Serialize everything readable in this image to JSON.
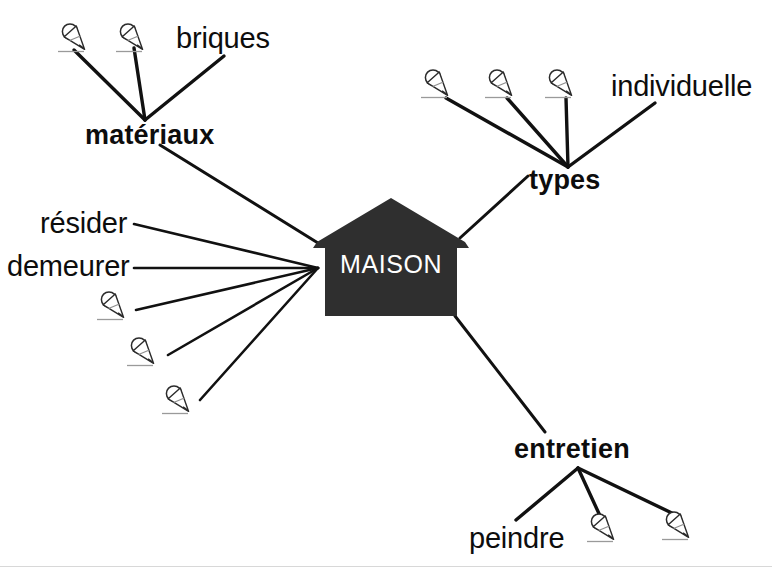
{
  "diagram": {
    "title": "MAISON",
    "type": "mind-map",
    "background_color": "#ffffff",
    "line_color": "#111111",
    "text_color": "#0d0d0d",
    "center_fill": "#2f2f2f",
    "center_text_color": "#ffffff",
    "center": {
      "label": "MAISON",
      "shape": "house-pentagon",
      "x": 313,
      "y": 196,
      "width": 156,
      "height": 122
    },
    "branches": [
      {
        "id": "materiaux",
        "label": "matériaux",
        "weight": "bold",
        "x": 85,
        "y": 120,
        "hub": {
          "x": 145,
          "y": 120
        },
        "children": [
          {
            "type": "icon",
            "icon": "pencil-writing-icon",
            "x": 57,
            "y": 22
          },
          {
            "type": "icon",
            "icon": "pencil-writing-icon",
            "x": 115,
            "y": 22
          },
          {
            "type": "text",
            "label": "briques",
            "weight": "regular",
            "x": 176,
            "y": 22
          }
        ]
      },
      {
        "id": "types",
        "label": "types",
        "weight": "bold",
        "x": 529,
        "y": 165,
        "hub": {
          "x": 568,
          "y": 167
        },
        "children": [
          {
            "type": "icon",
            "icon": "pencil-writing-icon",
            "x": 420,
            "y": 68
          },
          {
            "type": "icon",
            "icon": "pencil-writing-icon",
            "x": 484,
            "y": 68
          },
          {
            "type": "icon",
            "icon": "pencil-writing-icon",
            "x": 544,
            "y": 68
          },
          {
            "type": "text",
            "label": "individuelle",
            "weight": "regular",
            "x": 611,
            "y": 70
          }
        ]
      },
      {
        "id": "entretien",
        "label": "entretien",
        "weight": "bold",
        "x": 514,
        "y": 434,
        "hub": {
          "x": 578,
          "y": 468
        },
        "children": [
          {
            "type": "text",
            "label": "peindre",
            "weight": "regular",
            "x": 469,
            "y": 522
          },
          {
            "type": "icon",
            "icon": "pencil-writing-icon",
            "x": 586,
            "y": 512
          },
          {
            "type": "icon",
            "icon": "pencil-writing-icon",
            "x": 661,
            "y": 510
          }
        ]
      }
    ],
    "direct_leaves": [
      {
        "type": "text",
        "label": "résider",
        "weight": "regular",
        "x": 40,
        "y": 207
      },
      {
        "type": "text",
        "label": "demeurer",
        "weight": "regular",
        "x": 7,
        "y": 250
      },
      {
        "type": "icon",
        "icon": "pencil-writing-icon",
        "x": 96,
        "y": 290
      },
      {
        "type": "icon",
        "icon": "pencil-writing-icon",
        "x": 126,
        "y": 336
      },
      {
        "type": "icon",
        "icon": "pencil-writing-icon",
        "x": 161,
        "y": 384
      }
    ]
  }
}
